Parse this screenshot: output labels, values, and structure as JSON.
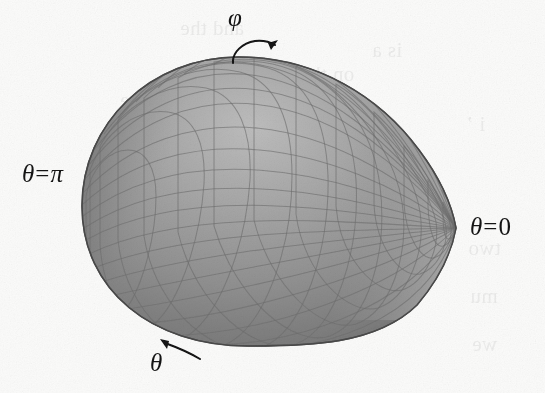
{
  "figure": {
    "title_semantic": "spherical-coordinate-teardrop-surface",
    "background_color": "#fbfbfa",
    "ink_color": "#141414",
    "surface": {
      "shape": "teardrop",
      "fill_light": "#b0b0b0",
      "fill_mid": "#8d8d8d",
      "fill_dark": "#5a5a5a",
      "mesh_line_color": "#6f6f6f",
      "outline_color": "#4a4a4a",
      "left_extent_px": 82,
      "right_tip_px": 456,
      "top_extent_px": 56,
      "bottom_extent_px": 346,
      "tip_y_px": 228,
      "mesh_phi_divisions": 24,
      "mesh_theta_divisions": 22
    },
    "labels": [
      {
        "name": "theta-pi",
        "symbol": "θ",
        "relation": "=",
        "value": "π",
        "text": "θ = π",
        "position": "left"
      },
      {
        "name": "theta-zero",
        "symbol": "θ",
        "relation": "=",
        "value": "0",
        "text": "θ = 0",
        "position": "right"
      },
      {
        "name": "phi",
        "symbol": "φ",
        "text": "φ",
        "position": "top",
        "arrow": "curved-arrow-clockwise-right"
      },
      {
        "name": "theta-rotation",
        "symbol": "θ",
        "text": "θ",
        "position": "bottom-left",
        "arrow": "curved-arrow-up-left"
      }
    ],
    "bleed_through_text": [
      {
        "text": "and the",
        "x": 232,
        "y": 26
      },
      {
        "text": "is a",
        "x": 300,
        "y": 48
      },
      {
        "text": "on the",
        "x": 255,
        "y": 72
      },
      {
        "text": "of the",
        "x": 188,
        "y": 96
      },
      {
        "text": "i ’",
        "x": 468,
        "y": 120
      },
      {
        "text": "two",
        "x": 470,
        "y": 242
      },
      {
        "text": "mu",
        "x": 470,
        "y": 290
      },
      {
        "text": "we",
        "x": 475,
        "y": 338
      }
    ]
  }
}
